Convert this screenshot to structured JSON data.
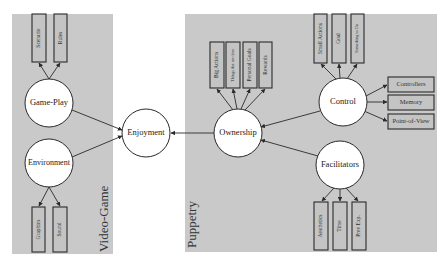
{
  "diagram": {
    "panels": {
      "video_game": {
        "label": "Video-Game",
        "color": "#c9c9c9"
      },
      "puppetry": {
        "label": "Puppetry",
        "color": "#c9c9c9"
      }
    },
    "nodes": {
      "enjoyment": "Enjoyment",
      "game_play": "Game-Play",
      "environment": "Environment",
      "ownership": "Ownership",
      "control": "Control",
      "facilitators": "Facilitators"
    },
    "boxes": {
      "scenario": "Scenario",
      "rules": "Rules",
      "graphics": "Graphics",
      "sound": "Sound",
      "big_actions": "Big Actions",
      "things": "Things that are done",
      "personal_goals": "Personal Goals",
      "rewards": "Rewards",
      "small_actions": "Small Actions",
      "goal": "Goal",
      "something": "Something to Do",
      "controllers": "Controllers",
      "memory": "Memory",
      "point_of_view": "Point-of-View",
      "aesthetics": "Aesthetics",
      "time": "Time",
      "prev_exp": "Prev Exp."
    },
    "edges": [
      [
        "game_play",
        "enjoyment"
      ],
      [
        "environment",
        "enjoyment"
      ],
      [
        "ownership",
        "enjoyment"
      ],
      [
        "control",
        "ownership"
      ],
      [
        "facilitators",
        "ownership"
      ],
      [
        "game_play",
        "scenario"
      ],
      [
        "game_play",
        "rules"
      ],
      [
        "environment",
        "graphics"
      ],
      [
        "environment",
        "sound"
      ],
      [
        "ownership",
        "big_actions"
      ],
      [
        "ownership",
        "things"
      ],
      [
        "ownership",
        "personal_goals"
      ],
      [
        "ownership",
        "rewards"
      ],
      [
        "control",
        "small_actions"
      ],
      [
        "control",
        "goal"
      ],
      [
        "control",
        "something"
      ],
      [
        "control",
        "controllers"
      ],
      [
        "control",
        "memory"
      ],
      [
        "control",
        "point_of_view"
      ],
      [
        "facilitators",
        "aesthetics"
      ],
      [
        "facilitators",
        "time"
      ],
      [
        "facilitators",
        "prev_exp"
      ]
    ]
  }
}
